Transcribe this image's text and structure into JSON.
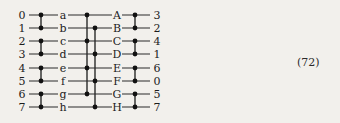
{
  "figure": {
    "caption_number": "(72)",
    "colors": {
      "background": "#f2f0ec",
      "line": "#2a2a2a",
      "node": "#111111",
      "text": "#1c1c1c"
    }
  },
  "network": {
    "row_count": 8,
    "inputs": [
      "0",
      "1",
      "2",
      "3",
      "4",
      "5",
      "6",
      "7"
    ],
    "outputs": [
      "3",
      "2",
      "4",
      "1",
      "6",
      "0",
      "5",
      "7"
    ],
    "stage_labels_lower": [
      "a",
      "b",
      "c",
      "d",
      "e",
      "f",
      "g",
      "h"
    ],
    "stage_labels_upper": [
      "A",
      "B",
      "C",
      "D",
      "E",
      "F",
      "G",
      "H"
    ],
    "geometry": {
      "row_y": [
        15,
        28,
        41,
        54,
        68,
        81,
        94,
        107
      ],
      "x_input_label": 22,
      "x_stage1_node": 41,
      "x_lower_label": 63,
      "x_stage2_even": 87,
      "x_stage2_odd": 95,
      "x_upper_label": 117,
      "x_stage3_node": 135,
      "x_output_label": 157,
      "wire_start": 29,
      "wire_end": 150
    },
    "stage1_switches": [
      {
        "name": "switch-1-0",
        "rows": [
          0,
          1
        ]
      },
      {
        "name": "switch-1-1",
        "rows": [
          2,
          3
        ]
      },
      {
        "name": "switch-1-2",
        "rows": [
          4,
          5
        ]
      },
      {
        "name": "switch-1-3",
        "rows": [
          6,
          7
        ]
      }
    ],
    "stage2_buses": [
      {
        "name": "bus-even",
        "rows": [
          0,
          2,
          4,
          6
        ],
        "x_key": "x_stage2_even"
      },
      {
        "name": "bus-odd",
        "rows": [
          1,
          3,
          5,
          7
        ],
        "x_key": "x_stage2_odd"
      }
    ],
    "stage3_switches": [
      {
        "name": "switch-3-0",
        "rows": [
          0,
          1
        ]
      },
      {
        "name": "switch-3-1",
        "rows": [
          2,
          3
        ]
      },
      {
        "name": "switch-3-2",
        "rows": [
          4,
          5
        ]
      },
      {
        "name": "switch-3-3",
        "rows": [
          6,
          7
        ]
      }
    ]
  },
  "caption": {
    "text": "(72)",
    "x": 297,
    "y": 56
  }
}
